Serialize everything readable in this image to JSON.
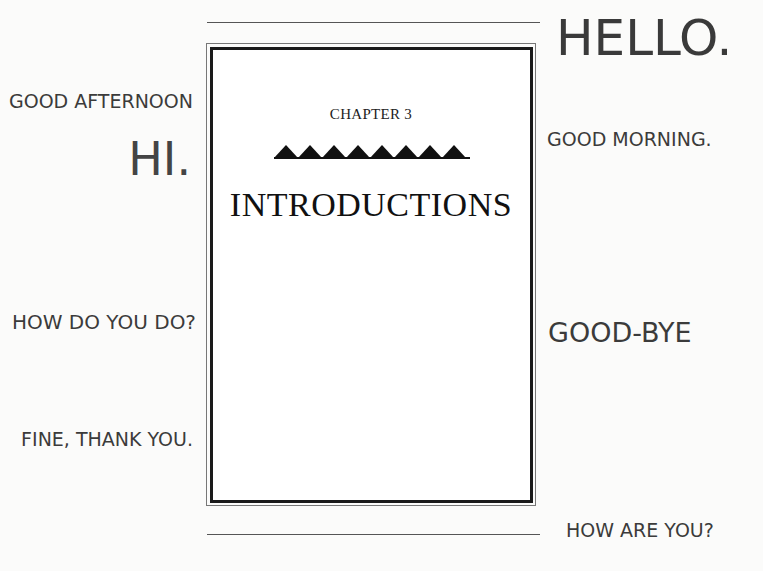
{
  "page": {
    "chapter_label": "CHAPTER 3",
    "chapter_title": "INTRODUCTIONS",
    "ornament": {
      "icon": "triangle-icon",
      "count": 8,
      "color": "#111111"
    }
  },
  "phrases": {
    "left": [
      {
        "text": "GOOD AFTERNOON"
      },
      {
        "text": "HI."
      },
      {
        "text": "HOW DO YOU DO?"
      },
      {
        "text": "FINE, THANK YOU."
      }
    ],
    "right": [
      {
        "text": "HELLO."
      },
      {
        "text": "GOOD MORNING."
      },
      {
        "text": "GOOD-BYE"
      },
      {
        "text": "HOW ARE YOU?"
      }
    ]
  }
}
